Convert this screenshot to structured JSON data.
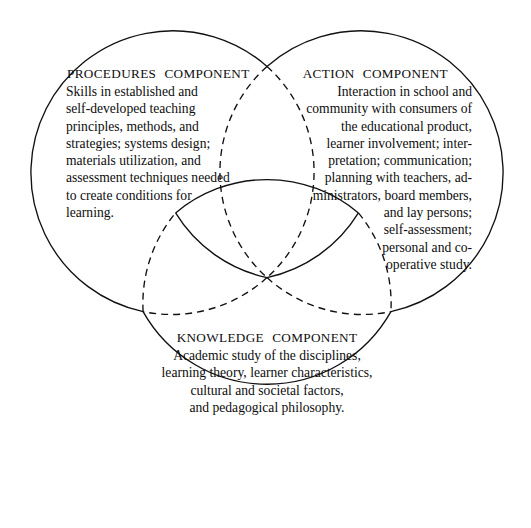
{
  "diagram": {
    "type": "venn",
    "title": "",
    "set_count": 3,
    "background_color": "#ffffff",
    "stroke_color": "#111111",
    "geometry": {
      "radius": 142,
      "circles": [
        {
          "id": "procedures",
          "cx": 172,
          "cy": 172
        },
        {
          "id": "action",
          "cx": 362,
          "cy": 172
        },
        {
          "id": "knowledge",
          "cx": 267,
          "cy": 350
        }
      ],
      "note": "arc segments outside overlap regions are solid; segments interior to overlaps are dashed; the central three-way region is bounded by solid arcs"
    }
  },
  "sets": {
    "procedures": {
      "heading": "PROCEDURES  COMPONENT",
      "lines": [
        "Skills in established and",
        "self-developed teaching",
        "principles, methods, and",
        "strategies; systems design;",
        "materials utilization, and",
        "assessment techniques needed",
        "to create conditions for",
        "learning."
      ]
    },
    "action": {
      "heading": "ACTION  COMPONENT",
      "lines": [
        "Interaction in school and",
        "community with consumers of",
        "the educational product,",
        "learner involvement; inter-",
        "pretation; communication;",
        "planning with teachers, ad-",
        "ministrators, board members,",
        "and lay persons;",
        "self-assessment;",
        "personal and co-",
        "operative study."
      ]
    },
    "knowledge": {
      "heading": "KNOWLEDGE  COMPONENT",
      "lines": [
        "Academic study of the disciplines,",
        "learning theory, learner characteristics,",
        "cultural and societal factors,",
        "and pedagogical philosophy."
      ]
    }
  }
}
